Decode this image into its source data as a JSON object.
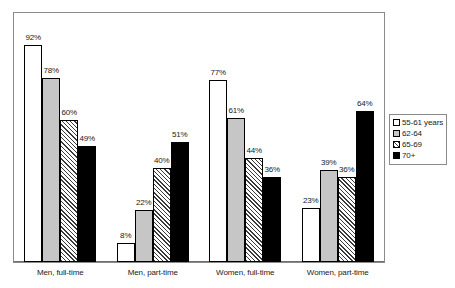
{
  "chart_data": {
    "type": "bar",
    "title": "",
    "subtitle": "",
    "xlabel": "",
    "ylabel": "",
    "ylim": [
      0,
      100
    ],
    "grid": false,
    "legend_position": "right",
    "value_suffix": "%",
    "categories": [
      "Men, full-time",
      "Men, part-time",
      "Women, full-time",
      "Women, part-time"
    ],
    "series": [
      {
        "name": "55-61 years",
        "fill": "white",
        "values": [
          92,
          8,
          77,
          23
        ],
        "labels": [
          "92%",
          "8%",
          "77%",
          "23%"
        ]
      },
      {
        "name": "62-64",
        "fill": "light-gray",
        "values": [
          78,
          22,
          61,
          39
        ],
        "labels": [
          "78%",
          "22%",
          "61%",
          "39%"
        ]
      },
      {
        "name": "65-69",
        "fill": "hatched",
        "values": [
          60,
          40,
          44,
          36
        ],
        "labels": [
          "60%",
          "40%",
          "44%",
          "36%"
        ]
      },
      {
        "name": "70+",
        "fill": "black",
        "values": [
          49,
          51,
          36,
          64
        ],
        "labels": [
          "49%",
          "51%",
          "36%",
          "64%"
        ]
      }
    ],
    "legend_entries": [
      "55-61 years",
      "62-64",
      "65-69",
      "70+"
    ],
    "colors": {
      "series_0": "#ffffff",
      "series_1": "#c6c6c6",
      "series_2": "#6f6f6f",
      "series_3": "#000000",
      "outline": "#000000",
      "frame": "#8a8a8a",
      "text": "#1a1a1a"
    }
  }
}
